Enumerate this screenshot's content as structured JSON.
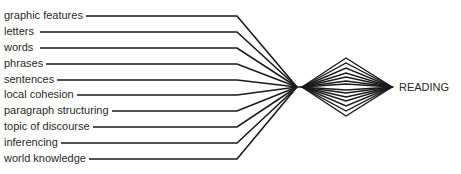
{
  "diagram": {
    "inputs": [
      {
        "label": "graphic features",
        "y": 16
      },
      {
        "label": "letters",
        "y": 32
      },
      {
        "label": "words",
        "y": 48
      },
      {
        "label": "phrases",
        "y": 64
      },
      {
        "label": "sentences",
        "y": 80
      },
      {
        "label": "local cohesion",
        "y": 95
      },
      {
        "label": "paragraph structuring",
        "y": 111
      },
      {
        "label": "topic of discourse",
        "y": 127
      },
      {
        "label": "inferencing",
        "y": 143
      },
      {
        "label": "world knowledge",
        "y": 159
      }
    ],
    "output": {
      "label": "READING"
    },
    "line_color": "#1a1a1a"
  }
}
